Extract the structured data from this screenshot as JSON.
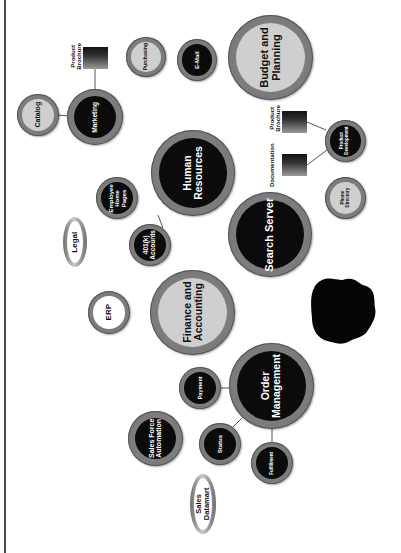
{
  "diagram": {
    "orientation": "rotated -90deg (text reads bottom-to-top)",
    "nodes": {
      "catalog": {
        "label": "Catalog",
        "style": "light"
      },
      "marketing": {
        "label": "Marketing",
        "style": "dark"
      },
      "purchasing": {
        "label": "Purchasing",
        "style": "light"
      },
      "email": {
        "label": "E-Mail",
        "style": "dark"
      },
      "budget_planning": {
        "label": "Budget and\nPlanning",
        "style": "light"
      },
      "human_resources": {
        "label": "Human\nResources",
        "style": "dark"
      },
      "employee_home_pages": {
        "label": "Employee\nHome\nPages",
        "style": "dark"
      },
      "accounts_401k": {
        "label": "401(k)\nAccounts",
        "style": "dark"
      },
      "legal": {
        "label": "Legal",
        "style": "white-oval"
      },
      "search_server": {
        "label": "Search Server",
        "style": "dark"
      },
      "product_development": {
        "label": "Product\nDevelopment",
        "style": "dark"
      },
      "phone_directory": {
        "label": "Phone\nDirectory",
        "style": "light"
      },
      "finance_accounting": {
        "label": "Finance and\nAccounting",
        "style": "light"
      },
      "erp": {
        "label": "ERP",
        "style": "white"
      },
      "order_management": {
        "label": "Order\nManagement",
        "style": "dark"
      },
      "payment": {
        "label": "Payment",
        "style": "dark"
      },
      "sales_force_automation": {
        "label": "Sales Force\nAutomation",
        "style": "dark"
      },
      "status": {
        "label": "Status",
        "style": "dark"
      },
      "fulfillment": {
        "label": "Fulfillment",
        "style": "dark"
      },
      "sales_datamart": {
        "label": "Sales\nDatamart",
        "style": "white-oval"
      }
    },
    "documents": {
      "marketing_brochure": {
        "label": "Product\nBrochure"
      },
      "dev_brochure": {
        "label": "Product\nBrochure"
      },
      "documentation": {
        "label": "Documentation"
      }
    },
    "edges": [
      [
        "catalog",
        "marketing"
      ],
      [
        "marketing",
        "marketing_brochure"
      ],
      [
        "human_resources",
        "employee_home_pages"
      ],
      [
        "human_resources",
        "accounts_401k"
      ],
      [
        "product_development",
        "dev_brochure"
      ],
      [
        "product_development",
        "documentation"
      ],
      [
        "order_management",
        "payment"
      ],
      [
        "order_management",
        "status"
      ],
      [
        "order_management",
        "fulfillment"
      ]
    ],
    "colors": {
      "dark_core": "#0b0b0b",
      "light_core": "#cfcfcf",
      "ring": "#7a7a7a",
      "edge": "#555555",
      "frame": "#4a4a4a"
    }
  }
}
